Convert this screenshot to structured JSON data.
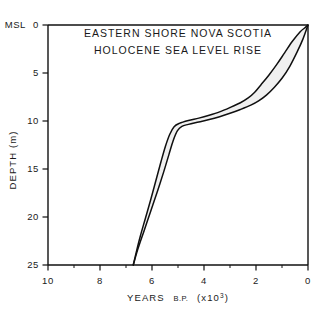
{
  "chart_data": {
    "type": "area",
    "title": "EASTERN SHORE  NOVA SCOTIA",
    "subtitle": "HOLOCENE SEA LEVEL RISE",
    "title_lines": [
      "EASTERN SHORE  NOVA SCOTIA",
      "HOLOCENE SEA LEVEL RISE"
    ],
    "xlabel": "YEARS B.P. (x10",
    "xlabel_exponent": "3",
    "xlabel_close": ")",
    "xlabel_full": "YEARS B.P. (x10³)",
    "xlabel_main": "YEARS",
    "xlabel_bp": "B.P.",
    "xlabel_units_open": "(x10",
    "ylabel": "DEPTH (m)",
    "y_zero_label": "MSL",
    "xlim": [
      10,
      0
    ],
    "ylim": [
      25,
      0
    ],
    "x_reversed": true,
    "y_inverted": true,
    "xticks": [
      10,
      8,
      6,
      4,
      2,
      0
    ],
    "xtick_labels": [
      "10",
      "8",
      "6",
      "4",
      "2",
      "0"
    ],
    "yticks": [
      0,
      5,
      10,
      15,
      20,
      25
    ],
    "ytick_labels": [
      "0",
      "5",
      "10",
      "15",
      "20",
      "25"
    ],
    "x_minor_ticks": [
      9,
      7,
      5,
      3,
      1
    ],
    "grid": false,
    "legend": null,
    "band_label": "Holocene sea level rise envelope",
    "band_fill_color": "#f0f0f0",
    "line_color": "#101010",
    "frame_color": "#101010",
    "background_color": "#ffffff",
    "series": [
      {
        "name": "upper envelope (younger / shallower limit)",
        "x": [
          6.72,
          6.55,
          6.3,
          6.05,
          5.8,
          5.55,
          5.35,
          5.18,
          5.02,
          4.85,
          4.6,
          4.2,
          3.8,
          3.4,
          3.0,
          2.6,
          2.2,
          1.9,
          1.6,
          1.3,
          1.0,
          0.7,
          0.4,
          0.2,
          0.0
        ],
        "y": [
          25.0,
          23.4,
          21.4,
          19.4,
          17.4,
          15.3,
          13.5,
          12.0,
          11.0,
          10.55,
          10.35,
          10.1,
          9.85,
          9.55,
          9.2,
          8.8,
          8.35,
          7.9,
          7.3,
          6.5,
          5.55,
          4.3,
          2.7,
          1.5,
          0.0
        ]
      },
      {
        "name": "lower envelope (older / deeper limit)",
        "x": [
          6.72,
          6.6,
          6.45,
          6.25,
          6.05,
          5.85,
          5.65,
          5.48,
          5.32,
          5.15,
          4.95,
          4.6,
          4.2,
          3.8,
          3.4,
          3.0,
          2.6,
          2.3,
          2.05,
          1.8,
          1.5,
          1.2,
          0.9,
          0.6,
          0.3,
          0.1,
          0.0
        ],
        "y": [
          25.0,
          23.6,
          22.0,
          20.1,
          18.2,
          16.2,
          14.2,
          12.6,
          11.4,
          10.6,
          10.25,
          9.95,
          9.7,
          9.4,
          9.05,
          8.6,
          8.1,
          7.6,
          7.0,
          6.2,
          5.2,
          4.1,
          2.9,
          1.7,
          0.7,
          0.25,
          0.0
        ]
      }
    ],
    "annotations": [
      {
        "text": "knee / inflection",
        "x": 5.0,
        "y": 10.6
      },
      {
        "text": "second inflection",
        "x": 2.0,
        "y": 8.1
      }
    ]
  }
}
